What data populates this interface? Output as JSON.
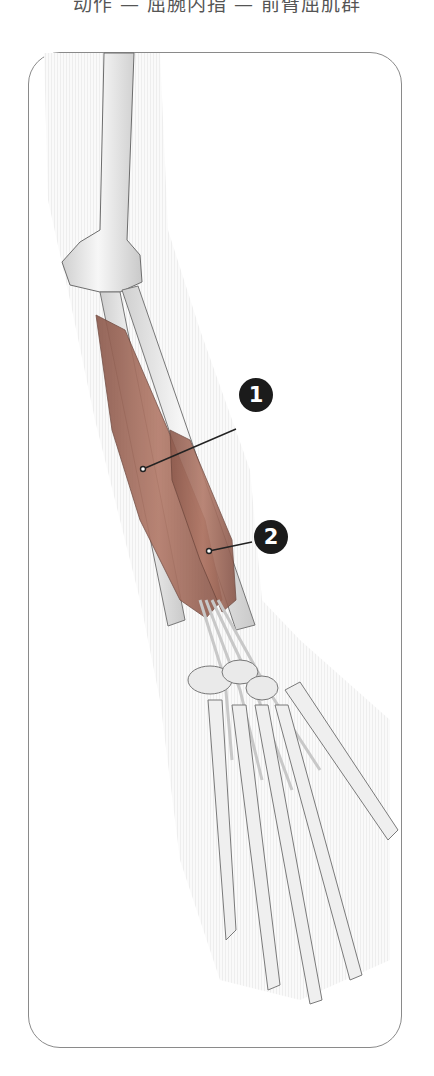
{
  "header": {
    "text": "动作 — 屈腕内指 — 前臂屈肌群"
  },
  "figure": {
    "colors": {
      "muscle": "#a9705f",
      "muscle_dark": "#7d4e43",
      "bone": "#efefef",
      "outline": "#8a8a8a",
      "callout": "#1b1b1b"
    },
    "callouts": [
      {
        "number": "1",
        "label_x": 256,
        "label_y": 395,
        "anchor_x": 143,
        "anchor_y": 469
      },
      {
        "number": "2",
        "label_x": 271,
        "label_y": 537,
        "anchor_x": 209,
        "anchor_y": 551
      }
    ]
  }
}
